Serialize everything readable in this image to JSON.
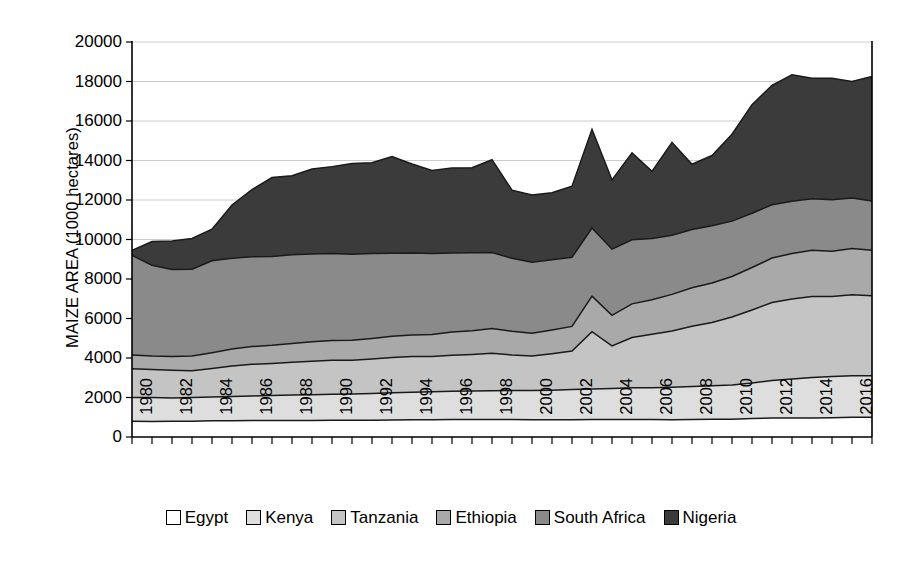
{
  "chart_data": {
    "type": "area",
    "stacked": true,
    "title": "",
    "xlabel": "",
    "ylabel": "MAIZE AREA (1000 hectares)",
    "ylim": [
      0,
      20000
    ],
    "ytick_labels": [
      "0",
      "2000",
      "4000",
      "6000",
      "8000",
      "10000",
      "12000",
      "14000",
      "16000",
      "18000",
      "20000"
    ],
    "ytick_values": [
      0,
      2000,
      4000,
      6000,
      8000,
      10000,
      12000,
      14000,
      16000,
      18000,
      20000
    ],
    "grid": true,
    "grid_axis": "y",
    "legend_position": "bottom",
    "x": [
      1980,
      1981,
      1982,
      1983,
      1984,
      1985,
      1986,
      1987,
      1988,
      1989,
      1990,
      1991,
      1992,
      1993,
      1994,
      1995,
      1996,
      1997,
      1998,
      1999,
      2000,
      2001,
      2002,
      2003,
      2004,
      2005,
      2006,
      2007,
      2008,
      2009,
      2010,
      2011,
      2012,
      2013,
      2014,
      2015,
      2016,
      2017
    ],
    "xtick_labels": [
      "1980",
      "1982",
      "1984",
      "1986",
      "1988",
      "1990",
      "1992",
      "1994",
      "1996",
      "1998",
      "2000",
      "2002",
      "2004",
      "2006",
      "2008",
      "2010",
      "2012",
      "2014",
      "2016"
    ],
    "xtick_values": [
      1980,
      1982,
      1984,
      1986,
      1988,
      1990,
      1992,
      1994,
      1996,
      1998,
      2000,
      2002,
      2004,
      2006,
      2008,
      2010,
      2012,
      2014,
      2016
    ],
    "xlim": [
      1980,
      2017
    ],
    "series": [
      {
        "name": "Egypt",
        "color": "#ffffff",
        "values": [
          800,
          790,
          800,
          800,
          820,
          820,
          830,
          830,
          840,
          840,
          850,
          850,
          850,
          860,
          870,
          870,
          880,
          880,
          880,
          880,
          870,
          870,
          870,
          880,
          890,
          890,
          880,
          870,
          880,
          900,
          900,
          940,
          960,
          960,
          960,
          980,
          1000,
          1000
        ]
      },
      {
        "name": "Kenya",
        "color": "#dedede",
        "values": [
          1200,
          1210,
          1180,
          1200,
          1200,
          1230,
          1250,
          1270,
          1290,
          1300,
          1320,
          1330,
          1350,
          1380,
          1400,
          1420,
          1440,
          1450,
          1460,
          1470,
          1480,
          1500,
          1530,
          1550,
          1570,
          1600,
          1620,
          1650,
          1680,
          1700,
          1730,
          1790,
          1900,
          1980,
          2050,
          2080,
          2100,
          2100
        ]
      },
      {
        "name": "Tanzania",
        "color": "#c4c4c4",
        "values": [
          1450,
          1420,
          1400,
          1350,
          1450,
          1550,
          1600,
          1620,
          1650,
          1700,
          1720,
          1700,
          1750,
          1780,
          1800,
          1780,
          1820,
          1850,
          1900,
          1800,
          1750,
          1850,
          1950,
          2900,
          2150,
          2550,
          2700,
          2850,
          3050,
          3200,
          3450,
          3700,
          3950,
          4050,
          4100,
          4050,
          4100,
          4050
        ]
      },
      {
        "name": "Ethiopia",
        "color": "#a9a9a9",
        "values": [
          700,
          680,
          700,
          750,
          800,
          850,
          900,
          920,
          950,
          980,
          1000,
          1020,
          1040,
          1080,
          1100,
          1120,
          1180,
          1200,
          1250,
          1200,
          1150,
          1200,
          1250,
          1800,
          1550,
          1700,
          1750,
          1850,
          1950,
          2000,
          2050,
          2150,
          2250,
          2300,
          2350,
          2300,
          2350,
          2300
        ]
      },
      {
        "name": "South Africa",
        "color": "#8a8a8a",
        "values": [
          5050,
          4600,
          4400,
          4400,
          4650,
          4600,
          4550,
          4500,
          4500,
          4450,
          4400,
          4350,
          4300,
          4200,
          4150,
          4100,
          4000,
          3950,
          3850,
          3700,
          3600,
          3550,
          3500,
          3450,
          3350,
          3250,
          3100,
          3000,
          2950,
          2900,
          2800,
          2750,
          2700,
          2650,
          2600,
          2600,
          2550,
          2500
        ]
      },
      {
        "name": "Nigeria",
        "color": "#3b3b3b",
        "values": [
          250,
          1200,
          1450,
          1550,
          1600,
          2700,
          3400,
          4000,
          4000,
          4300,
          4400,
          4600,
          4600,
          4900,
          4500,
          4200,
          4300,
          4300,
          4700,
          3450,
          3400,
          3400,
          3600,
          5000,
          3500,
          4400,
          3400,
          4700,
          3300,
          3550,
          4400,
          5500,
          6050,
          6400,
          6100,
          6150,
          5900,
          6300
        ]
      }
    ]
  },
  "legend": {
    "items": [
      {
        "label": "Egypt",
        "color": "#ffffff"
      },
      {
        "label": "Kenya",
        "color": "#dedede"
      },
      {
        "label": "Tanzania",
        "color": "#c4c4c4"
      },
      {
        "label": "Ethiopia",
        "color": "#a9a9a9"
      },
      {
        "label": "South Africa",
        "color": "#8a8a8a"
      },
      {
        "label": "Nigeria",
        "color": "#3b3b3b"
      }
    ]
  },
  "axes": {
    "y_title": "MAIZE AREA (1000 hectares)",
    "grid_color": "#cccccc",
    "axis_color": "#000000",
    "line_color": "#1a1a1a"
  }
}
